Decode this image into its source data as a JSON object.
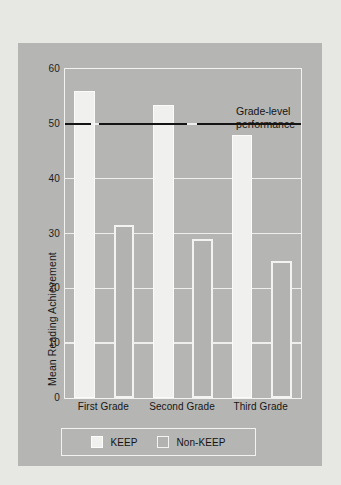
{
  "chart_data": {
    "type": "bar",
    "title": "",
    "xlabel": "",
    "ylabel": "Mean Reading Achievement",
    "categories": [
      "First Grade",
      "Second Grade",
      "Third Grade"
    ],
    "series": [
      {
        "name": "KEEP",
        "values": [
          56,
          53.5,
          48
        ]
      },
      {
        "name": "Non-KEEP",
        "values": [
          31.5,
          29,
          25
        ]
      }
    ],
    "ylim": [
      0,
      60
    ],
    "yticks": [
      0,
      10,
      20,
      30,
      40,
      50,
      60
    ],
    "ytick_labels": [
      "0",
      "10",
      "20",
      "30",
      "40",
      "50",
      "60"
    ],
    "grid": "horizontal",
    "legend_position": "bottom",
    "annotations": [
      {
        "text_line1": "Grade-level",
        "text_line2": "performance",
        "type": "reference-line",
        "value": 50
      }
    ],
    "colors": {
      "panel_background": "#b5b5b3",
      "page_background": "#e7e7e4",
      "keep_bar": "#f0f0ee",
      "nonkeep_bar": "#b2b2b0",
      "bar_outline": "#f6f6f4",
      "gridline": "#eeeeec",
      "reference_line": "#141414",
      "text": "#161616"
    }
  },
  "legend": {
    "items": [
      {
        "label": "KEEP"
      },
      {
        "label": "Non-KEEP"
      }
    ]
  }
}
